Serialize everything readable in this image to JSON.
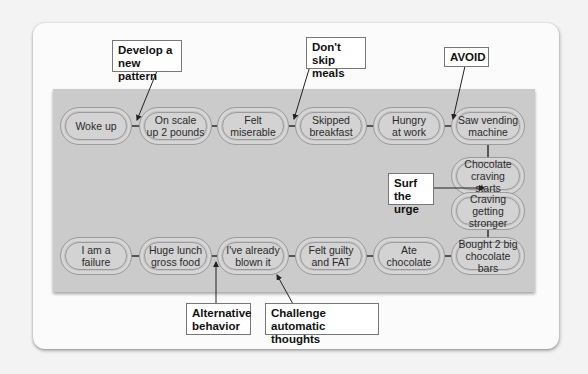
{
  "diagram": {
    "type": "behavior-chain",
    "chain_links": [
      {
        "id": "woke-up",
        "label": "Woke up"
      },
      {
        "id": "on-scale",
        "label": "On scale up 2 pounds"
      },
      {
        "id": "felt-miserable",
        "label": "Felt miserable"
      },
      {
        "id": "skipped-breakfast",
        "label": "Skipped breakfast"
      },
      {
        "id": "hungry-at-work",
        "label": "Hungry at work"
      },
      {
        "id": "saw-vending-machine",
        "label": "Saw vending machine"
      },
      {
        "id": "chocolate-craving-starts",
        "label": "Chocolate craving starts"
      },
      {
        "id": "craving-getting-stronger",
        "label": "Craving getting stronger"
      },
      {
        "id": "bought-chocolate-bars",
        "label": "Bought 2 big chocolate bars"
      },
      {
        "id": "ate-chocolate",
        "label": "Ate chocolate"
      },
      {
        "id": "felt-guilty",
        "label": "Felt guilty and FAT"
      },
      {
        "id": "already-blown-it",
        "label": "I've already blown it"
      },
      {
        "id": "huge-lunch",
        "label": "Huge lunch gross food"
      },
      {
        "id": "i-am-a-failure",
        "label": "I am a failure"
      }
    ],
    "callouts": [
      {
        "id": "develop-pattern",
        "label": "Develop a new pattern",
        "points_to": "between Woke up and On scale up 2 pounds"
      },
      {
        "id": "dont-skip",
        "label": "Don't skip meals",
        "points_to": "between Felt miserable and Skipped breakfast"
      },
      {
        "id": "avoid",
        "label": "AVOID",
        "points_to": "between Hungry at work and Saw vending machine"
      },
      {
        "id": "surf",
        "label": "Surf the urge",
        "points_to": "between Chocolate craving starts and Craving getting stronger"
      },
      {
        "id": "alternative",
        "label": "Alternative behavior",
        "points_to": "between Huge lunch gross food and I've already blown it"
      },
      {
        "id": "challenge",
        "label": "Challenge automatic thoughts",
        "points_to": "I've already blown it"
      }
    ]
  },
  "links": {
    "woke_up": [
      "Woke up"
    ],
    "on_scale": [
      "On scale",
      "up 2 pounds"
    ],
    "felt_miserable": [
      "Felt",
      "miserable"
    ],
    "skipped_breakfast": [
      "Skipped",
      "breakfast"
    ],
    "hungry_at_work": [
      "Hungry",
      "at work"
    ],
    "saw_vending": [
      "Saw vending",
      "machine"
    ],
    "choc_craving": [
      "Chocolate",
      "craving starts"
    ],
    "craving_stronger": [
      "Craving getting",
      "stronger"
    ],
    "bought_bars": [
      "Bought 2 big",
      "chocolate bars"
    ],
    "ate_choc": [
      "Ate",
      "chocolate"
    ],
    "felt_guilty": [
      "Felt guilty",
      "and FAT"
    ],
    "blown_it": [
      "I've already",
      "blown it"
    ],
    "huge_lunch": [
      "Huge lunch",
      "gross food"
    ],
    "failure": [
      "I am a failure"
    ]
  },
  "callouts": {
    "develop": [
      "Develop a",
      "new pattern"
    ],
    "dont_skip": [
      "Don't skip",
      "meals"
    ],
    "avoid": [
      "AVOID"
    ],
    "surf": [
      "Surf the",
      "urge"
    ],
    "alternative": [
      "Alternative",
      "behavior"
    ],
    "challenge": [
      "Challenge automatic",
      "thoughts"
    ]
  },
  "colors": {
    "panel": "#cbcbcb",
    "card": "#fbfbfb",
    "link_fill": "#d3d3d3",
    "link_stroke": "#9b9b9b",
    "connector": "#555555"
  }
}
